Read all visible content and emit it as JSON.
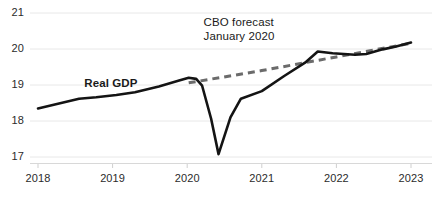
{
  "chart_data": {
    "type": "line",
    "title": "",
    "subtitle": "",
    "xlabel": "",
    "ylabel": "",
    "xlim": [
      2018,
      2023
    ],
    "ylim": [
      16.65,
      21.15
    ],
    "xticks": [
      2018,
      2019,
      2020,
      2021,
      2022,
      2023
    ],
    "xticklabels": [
      "2018",
      "2019",
      "2020",
      "2021",
      "2022",
      "2023"
    ],
    "yticks": [
      17,
      18,
      19,
      20,
      21
    ],
    "yticklabels": [
      "17",
      "18",
      "19",
      "20",
      "21"
    ],
    "grid": "horizontal",
    "legend": "inline-annotations",
    "series": [
      {
        "name": "Real GDP",
        "style": "solid",
        "color": "#141414",
        "width": 2.6,
        "points": [
          [
            2018.0,
            18.35
          ],
          [
            2018.55,
            18.62
          ],
          [
            2018.78,
            18.66
          ],
          [
            2019.05,
            18.72
          ],
          [
            2019.3,
            18.8
          ],
          [
            2019.62,
            18.96
          ],
          [
            2019.88,
            19.12
          ],
          [
            2020.02,
            19.2
          ],
          [
            2020.12,
            19.17
          ],
          [
            2020.2,
            18.98
          ],
          [
            2020.32,
            18.07
          ],
          [
            2020.42,
            17.08
          ],
          [
            2020.58,
            18.1
          ],
          [
            2020.72,
            18.62
          ],
          [
            2021.0,
            18.83
          ],
          [
            2021.3,
            19.25
          ],
          [
            2021.58,
            19.62
          ],
          [
            2021.75,
            19.93
          ],
          [
            2021.95,
            19.88
          ],
          [
            2022.25,
            19.84
          ],
          [
            2022.4,
            19.86
          ],
          [
            2022.62,
            19.99
          ],
          [
            2022.8,
            20.07
          ],
          [
            2023.0,
            20.18
          ]
        ]
      },
      {
        "name": "CBO forecast January 2020",
        "style": "dashed",
        "color": "#6b6b6b",
        "width": 3.0,
        "points": [
          [
            2020.02,
            19.06
          ],
          [
            2021.0,
            19.4
          ],
          [
            2022.0,
            19.78
          ],
          [
            2023.0,
            20.16
          ]
        ]
      }
    ],
    "annotations": [
      {
        "name": "real-gdp-label",
        "text": "Real GDP",
        "x": 2018.62,
        "y": 19.02,
        "bold": true
      },
      {
        "name": "cbo-forecast-label",
        "line1": "CBO forecast",
        "line2": "January 2020",
        "x": 2020.22,
        "y": 20.72,
        "bold": false
      }
    ],
    "axis_color": "#d8d8d8",
    "grid_color": "#e8e8e8",
    "tick_color": "#2b2b2b"
  }
}
